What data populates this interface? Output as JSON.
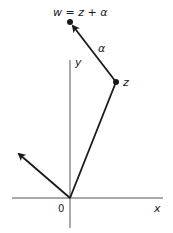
{
  "diagram": {
    "type": "complex-plane-vector-addition",
    "labels": {
      "w": "w = z + α",
      "z": "z",
      "alpha": "α",
      "x_axis": "x",
      "y_axis": "y",
      "origin": "0"
    },
    "colors": {
      "ink": "#1a1a1a",
      "axis": "#555555",
      "background": "#ffffff"
    },
    "points": {
      "origin": [
        70,
        198
      ],
      "z": [
        116,
        82
      ],
      "w": [
        70,
        22
      ],
      "alpha_from_origin_tip": [
        17,
        152
      ]
    }
  }
}
